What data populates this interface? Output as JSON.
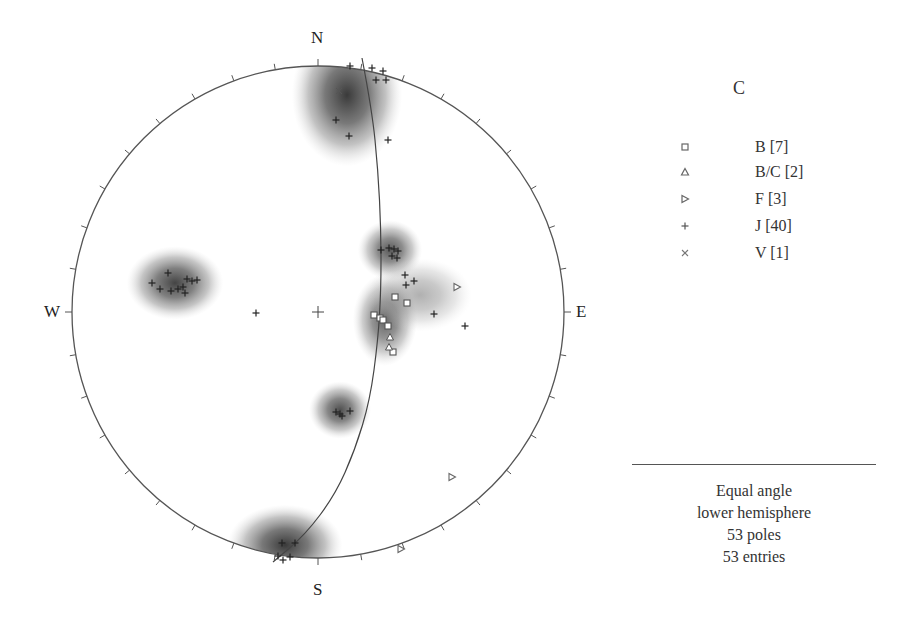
{
  "chart_data": {
    "type": "scatter",
    "subtype": "stereonet",
    "title": "C",
    "projection": "Equal angle",
    "hemisphere": "lower hemisphere",
    "direction_labels": {
      "north": "N",
      "south": "S",
      "east": "E",
      "west": "W"
    },
    "tick_interval_deg": 10,
    "summary": [
      "Equal angle",
      "lower hemisphere",
      "53 poles",
      "53 entries"
    ],
    "poles_count": 53,
    "entries_count": 53,
    "legend": [
      {
        "label": "B [7]",
        "set": "B",
        "count": 7,
        "symbol": "square"
      },
      {
        "label": "B/C [2]",
        "set": "B/C",
        "count": 2,
        "symbol": "triangle-up"
      },
      {
        "label": "F [3]",
        "set": "F",
        "count": 3,
        "symbol": "triangle-right"
      },
      {
        "label": "J [40]",
        "set": "J",
        "count": 40,
        "symbol": "plus"
      },
      {
        "label": "V [1]",
        "set": "V",
        "count": 1,
        "symbol": "x"
      }
    ],
    "center_px": [
      318,
      312
    ],
    "radius_px": 246,
    "great_circle_px": [
      [
        362,
        58
      ],
      [
        372,
        110
      ],
      [
        378,
        170
      ],
      [
        381,
        230
      ],
      [
        381,
        290
      ],
      [
        378,
        340
      ],
      [
        370,
        400
      ],
      [
        355,
        450
      ],
      [
        335,
        495
      ],
      [
        305,
        535
      ],
      [
        273,
        562
      ]
    ],
    "density_contours": [
      {
        "cx": 347,
        "cy": 95,
        "rx": 48,
        "ry": 62,
        "peak": 0.85
      },
      {
        "cx": 175,
        "cy": 283,
        "rx": 42,
        "ry": 32,
        "peak": 0.8
      },
      {
        "cx": 390,
        "cy": 250,
        "rx": 28,
        "ry": 26,
        "peak": 0.7
      },
      {
        "cx": 385,
        "cy": 320,
        "rx": 28,
        "ry": 40,
        "peak": 0.65
      },
      {
        "cx": 420,
        "cy": 295,
        "rx": 45,
        "ry": 32,
        "peak": 0.25
      },
      {
        "cx": 340,
        "cy": 410,
        "rx": 27,
        "ry": 25,
        "peak": 0.75
      },
      {
        "cx": 285,
        "cy": 545,
        "rx": 50,
        "ry": 35,
        "peak": 0.9
      }
    ],
    "points": {
      "B": [
        [
          395,
          297
        ],
        [
          407,
          303
        ],
        [
          374,
          315
        ],
        [
          380,
          318
        ],
        [
          383,
          320
        ],
        [
          388,
          326
        ],
        [
          393,
          352
        ]
      ],
      "B/C": [
        [
          390,
          337
        ],
        [
          389,
          347
        ]
      ],
      "F": [
        [
          457,
          287
        ],
        [
          452,
          477
        ],
        [
          401,
          549
        ]
      ],
      "J": [
        [
          372,
          68
        ],
        [
          383,
          71
        ],
        [
          350,
          66
        ],
        [
          376,
          80
        ],
        [
          386,
          80
        ],
        [
          388,
          140
        ],
        [
          336,
          120
        ],
        [
          349,
          136
        ],
        [
          381,
          250
        ],
        [
          389,
          248
        ],
        [
          394,
          249
        ],
        [
          398,
          251
        ],
        [
          392,
          256
        ],
        [
          397,
          258
        ],
        [
          405,
          275
        ],
        [
          414,
          281
        ],
        [
          406,
          285
        ],
        [
          434,
          314
        ],
        [
          465,
          326
        ],
        [
          168,
          273
        ],
        [
          152,
          283
        ],
        [
          160,
          289
        ],
        [
          171,
          291
        ],
        [
          178,
          289
        ],
        [
          183,
          287
        ],
        [
          185,
          293
        ],
        [
          192,
          281
        ],
        [
          197,
          280
        ],
        [
          187,
          279
        ],
        [
          256,
          313
        ],
        [
          336,
          412
        ],
        [
          340,
          414
        ],
        [
          342,
          416
        ],
        [
          350,
          411
        ],
        [
          282,
          543
        ],
        [
          295,
          543
        ],
        [
          283,
          560
        ],
        [
          290,
          557
        ],
        [
          278,
          556
        ]
      ],
      "V": [
        [
          339,
          91
        ]
      ]
    }
  }
}
